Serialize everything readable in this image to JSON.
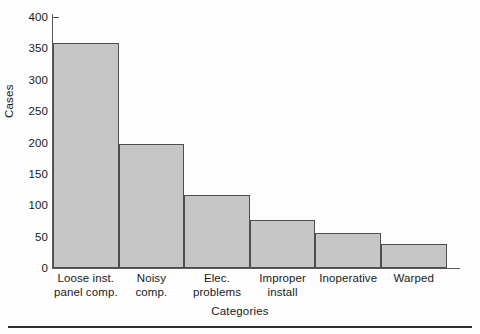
{
  "chart_data": {
    "type": "bar",
    "title": "",
    "xlabel": "Categories",
    "ylabel": "Cases",
    "categories": [
      "Loose inst. panel comp.",
      "Noisy comp.",
      "Elec. problems",
      "Improper install",
      "Inoperative",
      "Warped"
    ],
    "category_lines": [
      [
        "Loose inst.",
        "panel comp."
      ],
      [
        "Noisy",
        "comp."
      ],
      [
        "Elec.",
        "problems"
      ],
      [
        "Improper",
        "install"
      ],
      [
        "Inoperative"
      ],
      [
        "Warped"
      ]
    ],
    "values": [
      358,
      197,
      117,
      77,
      56,
      38
    ],
    "ylim": [
      0,
      400
    ],
    "yticks": [
      0,
      50,
      100,
      150,
      200,
      250,
      300,
      350,
      400
    ],
    "ytick_labels": [
      "0",
      "50",
      "100",
      "150",
      "200",
      "250",
      "300",
      "350",
      "400"
    ],
    "grid": false,
    "legend": null,
    "orientation": "vertical",
    "bar_fill_color": "#c6c6c6",
    "bar_edge_color": "#4a4f53",
    "axis_color": "#555a5e",
    "text_color": "#1a1a1a"
  }
}
